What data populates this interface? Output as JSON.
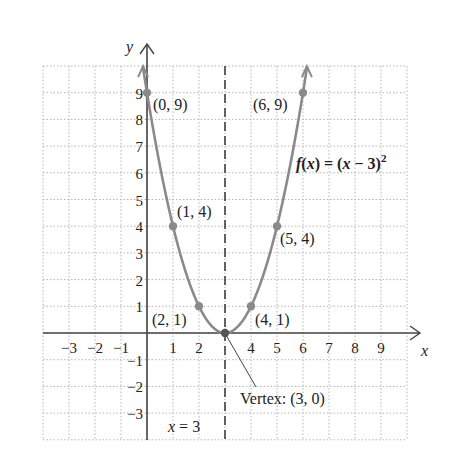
{
  "chart_data": {
    "type": "line",
    "title": "",
    "function_label": "f(x) = (x − 3)²",
    "function_label_parts": {
      "f": "f",
      "x1": "x",
      "eq": " = (",
      "x2": "x",
      "rest": " − 3)",
      "sup": "2"
    },
    "xlabel": "x",
    "ylabel": "y",
    "xlim": [
      -4,
      10
    ],
    "ylim": [
      -4,
      10
    ],
    "grid": true,
    "x_ticks": [
      -3,
      -2,
      -1,
      1,
      2,
      4,
      5,
      6,
      7,
      8,
      9
    ],
    "x_tick_labels": [
      "−3",
      "−2",
      "−1",
      "1",
      "2",
      "4",
      "5",
      "6",
      "7",
      "8",
      "9"
    ],
    "y_ticks": [
      9,
      8,
      7,
      6,
      5,
      4,
      3,
      2,
      1,
      -1,
      -2,
      -3
    ],
    "y_tick_labels": [
      "9",
      "8",
      "7",
      "6",
      "5",
      "4",
      "3",
      "2",
      "1",
      "−1",
      "−2",
      "−3"
    ],
    "series": [
      {
        "name": "f(x) = (x − 3)^2",
        "x": [
          0,
          1,
          2,
          3,
          4,
          5,
          6
        ],
        "y": [
          9,
          4,
          1,
          0,
          1,
          4,
          9
        ]
      }
    ],
    "points": [
      {
        "x": 0,
        "y": 9,
        "label": "(0, 9)"
      },
      {
        "x": 1,
        "y": 4,
        "label": "(1, 4)"
      },
      {
        "x": 2,
        "y": 1,
        "label": "(2, 1)"
      },
      {
        "x": 3,
        "y": 0,
        "label": "Vertex: (3, 0)"
      },
      {
        "x": 4,
        "y": 1,
        "label": "(4, 1)"
      },
      {
        "x": 5,
        "y": 4,
        "label": "(5, 4)"
      },
      {
        "x": 6,
        "y": 9,
        "label": "(6, 9)"
      }
    ],
    "axis_of_symmetry": {
      "x": 3,
      "label": "x = 3",
      "label_parts": {
        "x": "x",
        "rest": " = 3"
      }
    },
    "colors": {
      "curve": "#8a8a8a",
      "grid": "#b5b5b5",
      "axes": "#333333",
      "points": "#8a8a8a"
    }
  }
}
